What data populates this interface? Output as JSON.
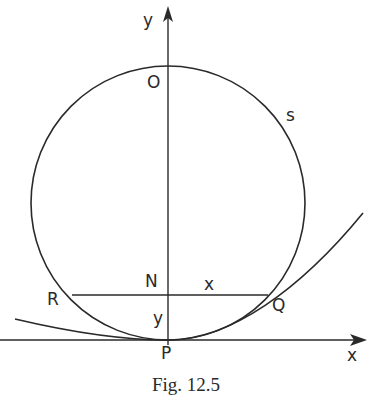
{
  "figure": {
    "caption": "Fig. 12.5",
    "labels": {
      "y_axis": "y",
      "x_axis": "x",
      "O": "O",
      "s": "s",
      "N": "N",
      "R": "R",
      "Q": "Q",
      "P": "P",
      "segment_x": "x",
      "segment_y": "y"
    },
    "elements": {
      "circle": "circle of curvature tangent at P with center on y-axis, top point O",
      "curve": "curve tangent to x-axis at P passing through Q",
      "chord": "horizontal chord RNQ",
      "axes": "x-axis through P, y-axis through P and O"
    },
    "colors": {
      "ink": "#2a2a2a",
      "background": "#ffffff"
    }
  }
}
